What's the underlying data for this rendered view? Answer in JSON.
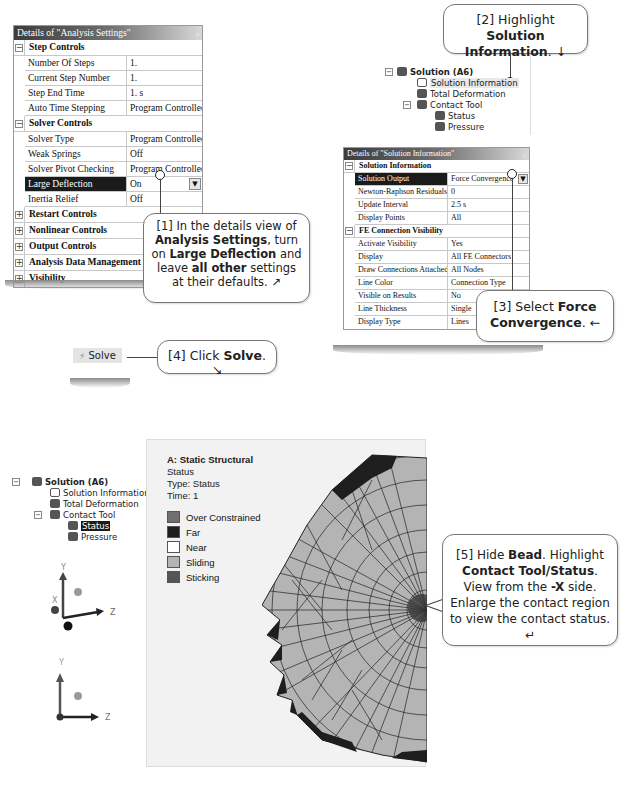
{
  "analysis_panel": {
    "title": "Details of \"Analysis Settings\"",
    "pin": "ᵩ",
    "groups": [
      {
        "label": "Step Controls",
        "toggle": "−"
      },
      {
        "label": "Solver Controls",
        "toggle": "−"
      },
      {
        "label": "Restart Controls",
        "toggle": "+"
      },
      {
        "label": "Nonlinear Controls",
        "toggle": "+"
      },
      {
        "label": "Output Controls",
        "toggle": "+"
      },
      {
        "label": "Analysis Data Management",
        "toggle": "+"
      },
      {
        "label": "Visibility",
        "toggle": "+"
      }
    ],
    "step_rows": [
      {
        "key": "Number Of Steps",
        "value": "1."
      },
      {
        "key": "Current Step Number",
        "value": "1."
      },
      {
        "key": "Step End Time",
        "value": "1. s"
      },
      {
        "key": "Auto Time Stepping",
        "value": "Program Controlled"
      }
    ],
    "solver_rows": [
      {
        "key": "Solver Type",
        "value": "Program Controlled"
      },
      {
        "key": "Weak Springs",
        "value": "Off"
      },
      {
        "key": "Solver Pivot Checking",
        "value": "Program Controlled"
      },
      {
        "key": "Large Deflection",
        "value": "On"
      },
      {
        "key": "Inertia Relief",
        "value": "Off"
      }
    ],
    "dropdown_icon": "▼"
  },
  "callouts": {
    "c1": {
      "pre": "[1] In the details view of ",
      "b1": "Analysis Settings",
      "mid1": ", turn on ",
      "b2": "Large Deflection",
      "mid2": " and leave ",
      "b3": "all other",
      "post": " settings at their defaults. ↗"
    },
    "c2": {
      "pre": "[2] Highlight ",
      "b1": "Solution Information",
      "post": ". ↓"
    },
    "c3": {
      "pre": "[3] Select ",
      "b1": "Force Convergence",
      "post": ". ←"
    },
    "c4": {
      "pre": "[4] Click ",
      "b1": "Solve",
      "post": ". ↘"
    },
    "c5": {
      "pre": "[5] Hide ",
      "b1": "Bead",
      "mid1": ".  Highlight ",
      "b2": "Contact Tool/Status",
      "mid2": ". View from the ",
      "b3": "-X",
      "post": " side. Enlarge the contact region to view the contact status. ↵"
    }
  },
  "tree_top": {
    "root": "Solution (A6)",
    "items": [
      "Solution Information",
      "Total Deformation",
      "Contact Tool",
      "Status",
      "Pressure"
    ]
  },
  "solution_panel": {
    "title": "Details of \"Solution Information\"",
    "pin": "ᵩ",
    "groups": [
      {
        "label": "Solution Information",
        "toggle": "−"
      },
      {
        "label": "FE Connection Visibility",
        "toggle": "−"
      }
    ],
    "info_rows": [
      {
        "key": "Solution Output",
        "value": "Force Convergence"
      },
      {
        "key": "Newton-Raphson Residuals",
        "value": "0"
      },
      {
        "key": "Update Interval",
        "value": "2.5 s"
      },
      {
        "key": "Display Points",
        "value": "All"
      }
    ],
    "fe_rows": [
      {
        "key": "Activate Visibility",
        "value": "Yes"
      },
      {
        "key": "Display",
        "value": "All FE Connectors"
      },
      {
        "key": "Draw Connections Attached To",
        "value": "All Nodes"
      },
      {
        "key": "Line Color",
        "value": "Connection Type"
      },
      {
        "key": "Visible on Results",
        "value": "No"
      },
      {
        "key": "Line Thickness",
        "value": "Single"
      },
      {
        "key": "Display Type",
        "value": "Lines"
      }
    ],
    "dropdown_icon": "▼"
  },
  "solve": {
    "icon": "⚡",
    "label": "Solve"
  },
  "tree_bottom": {
    "root": "Solution (A6)",
    "items": [
      "Solution Information",
      "Total Deformation",
      "Contact Tool",
      "Status",
      "Pressure"
    ]
  },
  "axes": {
    "y": "Y",
    "x": "X",
    "z": "Z"
  },
  "result": {
    "title": "A: Static Structural",
    "line2": "Status",
    "line3": "Type: Status",
    "line4": "Time: 1",
    "legend": [
      {
        "label": "Over Constrained",
        "color": "#6f6f6f"
      },
      {
        "label": "Far",
        "color": "#1e1e1e"
      },
      {
        "label": "Near",
        "color": "#ffffff"
      },
      {
        "label": "Sliding",
        "color": "#b4b4b4"
      },
      {
        "label": "Sticking",
        "color": "#555555"
      }
    ]
  }
}
